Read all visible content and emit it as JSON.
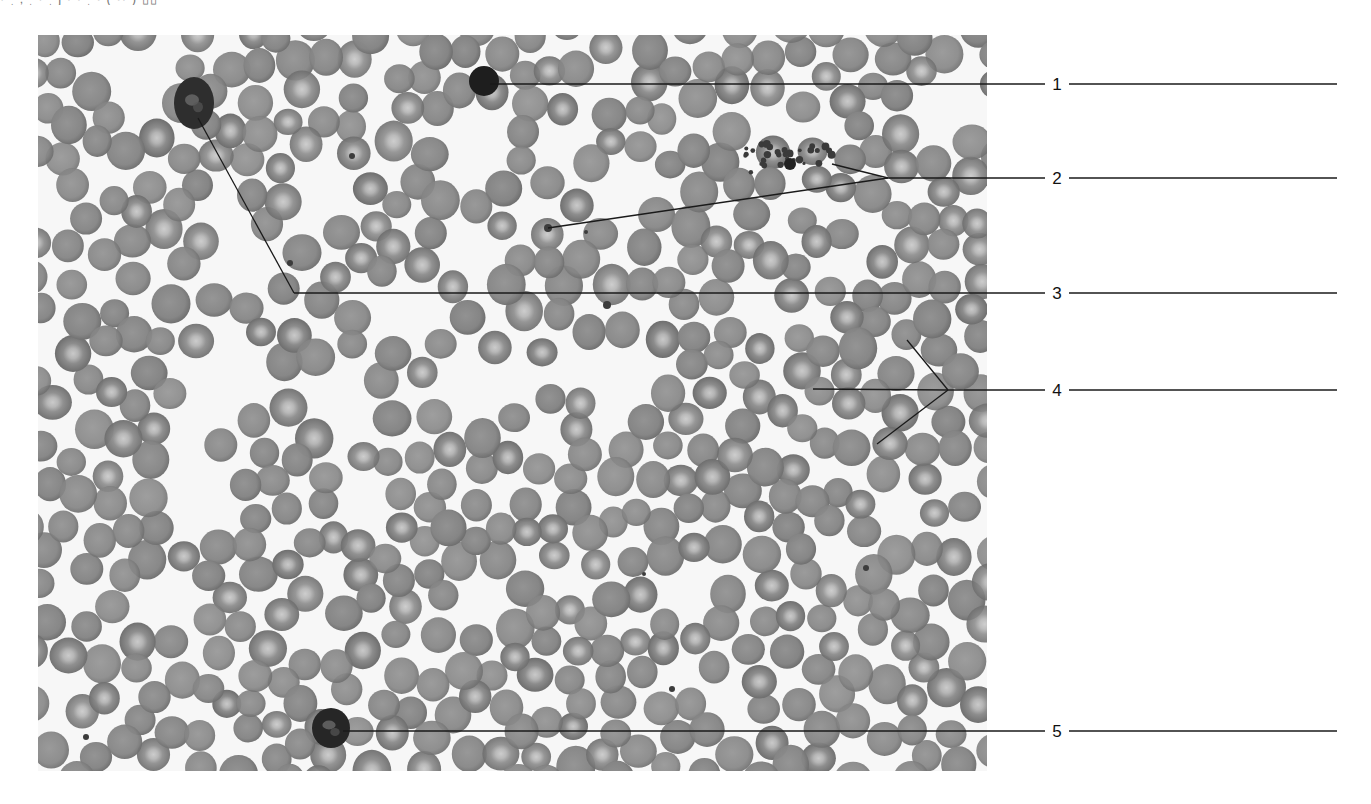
{
  "figure": {
    "type": "labeled micrograph",
    "top_text_fragment": "· ˌ   ‚  ˌ      ·   ˌ     ȷ  ·     ·  ˌ    ·    ( ·· )  ▯▯",
    "micrograph": {
      "x": 38,
      "y": 35,
      "width": 949,
      "height": 736,
      "background_color": "#f7f7f7",
      "cell_color": "#8c8c8c",
      "cell_center_color": "#c9c9c9",
      "cell_edge_color": "#6e6e6e",
      "cell_radius": 17,
      "dark_cells": [
        {
          "name": "small-lymphocyte",
          "cx": 484,
          "cy": 81,
          "r": 15,
          "color": "#1e1e1e"
        },
        {
          "name": "neutrophil-top-left",
          "cx": 194,
          "cy": 103,
          "rx": 20,
          "ry": 26,
          "color": "#2e2e2e"
        },
        {
          "name": "neutrophil-bottom",
          "cx": 331,
          "cy": 728,
          "rx": 19,
          "ry": 20,
          "color": "#262626"
        }
      ],
      "platelets": [
        {
          "cx": 548,
          "cy": 228,
          "r": 4
        },
        {
          "cx": 586,
          "cy": 232,
          "r": 2
        },
        {
          "cx": 290,
          "cy": 263,
          "r": 3
        },
        {
          "cx": 352,
          "cy": 156,
          "r": 3
        },
        {
          "cx": 607,
          "cy": 305,
          "r": 4
        },
        {
          "cx": 866,
          "cy": 568,
          "r": 3
        },
        {
          "cx": 672,
          "cy": 689,
          "r": 3
        },
        {
          "cx": 86,
          "cy": 737,
          "r": 3
        },
        {
          "cx": 644,
          "cy": 574,
          "r": 2
        }
      ],
      "platelet_cluster": {
        "cx": 785,
        "cy": 158,
        "w": 100,
        "h": 30
      }
    },
    "labels": [
      {
        "id": "1",
        "text": "1",
        "text_x": 1057,
        "y": 84,
        "pointers": [
          [
            490,
            84
          ]
        ],
        "junction": null
      },
      {
        "id": "2",
        "text": "2",
        "text_x": 1057,
        "y": 178,
        "pointers": [
          [
            548,
            228
          ],
          [
            832,
            164
          ]
        ],
        "junction": [
          888,
          175
        ]
      },
      {
        "id": "3",
        "text": "3",
        "text_x": 1057,
        "y": 293,
        "pointers": [
          [
            198,
            118
          ]
        ],
        "junction": [
          294,
          292
        ]
      },
      {
        "id": "4",
        "text": "4",
        "text_x": 1057,
        "y": 390,
        "pointers": [
          [
            907,
            340
          ],
          [
            813,
            389
          ],
          [
            877,
            444
          ]
        ],
        "junction": [
          948,
          389
        ]
      },
      {
        "id": "5",
        "text": "5",
        "text_x": 1057,
        "y": 731,
        "pointers": [
          [
            343,
            731
          ]
        ],
        "junction": null
      }
    ],
    "label_line_end_x": 1337,
    "label_line_color": "#1a1a1a"
  }
}
